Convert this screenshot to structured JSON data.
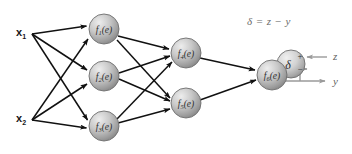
{
  "diagram": {
    "background": "#ffffff",
    "edge_color": "#111111",
    "feedback_color": "#9a9a9a",
    "node_fill_light": "#e2e2e2",
    "node_fill_dark": "#8e8e8e",
    "node_stroke": "#6e6e6e"
  },
  "inputs": [
    {
      "name": "input-x1",
      "label": "x",
      "sub": "1",
      "x": 16,
      "y": 33
    },
    {
      "name": "input-x2",
      "label": "x",
      "sub": "2",
      "x": 16,
      "y": 119
    }
  ],
  "nodes": [
    {
      "name": "hidden-node-1",
      "label": "f",
      "sub": "1",
      "arg": "(e)",
      "cx": 104,
      "cy": 29,
      "r": 15
    },
    {
      "name": "hidden-node-2",
      "label": "f",
      "sub": "2",
      "arg": "(e)",
      "cx": 104,
      "cy": 76,
      "r": 15
    },
    {
      "name": "hidden-node-3",
      "label": "f",
      "sub": "3",
      "arg": "(e)",
      "cx": 104,
      "cy": 126,
      "r": 15
    },
    {
      "name": "hidden-node-4",
      "label": "f",
      "sub": "4",
      "arg": "(e)",
      "cx": 186,
      "cy": 53,
      "r": 15
    },
    {
      "name": "hidden-node-5",
      "label": "f",
      "sub": "5",
      "arg": "(e)",
      "cx": 186,
      "cy": 103,
      "r": 15
    },
    {
      "name": "output-node-6",
      "label": "f",
      "sub": "6",
      "arg": "(e)",
      "cx": 272,
      "cy": 75,
      "r": 15
    }
  ],
  "delta_node": {
    "name": "delta-node",
    "symbol": "δ",
    "plus": "+",
    "minus": "−",
    "cx": 291,
    "cy": 64,
    "r": 14
  },
  "equation": {
    "name": "delta-equation",
    "text": "δ = z − y",
    "x": 247,
    "y": 22
  },
  "signals": [
    {
      "name": "target-label-z",
      "text": "z",
      "x": 333,
      "y": 58
    },
    {
      "name": "output-label-y",
      "text": "y",
      "x": 333,
      "y": 83
    }
  ],
  "edges": {
    "input_to_hidden": [
      {
        "from": "input-x1",
        "to": "hidden-node-1"
      },
      {
        "from": "input-x1",
        "to": "hidden-node-2"
      },
      {
        "from": "input-x1",
        "to": "hidden-node-3"
      },
      {
        "from": "input-x2",
        "to": "hidden-node-1"
      },
      {
        "from": "input-x2",
        "to": "hidden-node-2"
      },
      {
        "from": "input-x2",
        "to": "hidden-node-3"
      }
    ],
    "hidden_to_layer2": [
      {
        "from": "hidden-node-1",
        "to": "hidden-node-4"
      },
      {
        "from": "hidden-node-1",
        "to": "hidden-node-5"
      },
      {
        "from": "hidden-node-2",
        "to": "hidden-node-4"
      },
      {
        "from": "hidden-node-2",
        "to": "hidden-node-5"
      },
      {
        "from": "hidden-node-3",
        "to": "hidden-node-4"
      },
      {
        "from": "hidden-node-3",
        "to": "hidden-node-5"
      }
    ],
    "layer2_to_output": [
      {
        "from": "hidden-node-4",
        "to": "output-node-6"
      },
      {
        "from": "hidden-node-5",
        "to": "output-node-6"
      }
    ],
    "feedback": [
      {
        "from": "target-label-z",
        "to": "delta-node-plus"
      },
      {
        "from": "output-node-6",
        "to": "output-label-y"
      },
      {
        "from": "output-node-6",
        "to": "delta-node-minus"
      }
    ]
  }
}
